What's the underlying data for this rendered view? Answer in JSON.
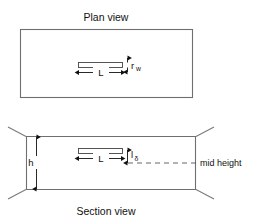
{
  "figure": {
    "background_color": "#ffffff",
    "outline_color": "#6f6f6f",
    "annotation_color": "#111111",
    "width": 262,
    "height": 224
  },
  "plan_view": {
    "title": "Plan view",
    "crack_length_label": "L",
    "crack_width_label": "r",
    "crack_width_subscript": "w"
  },
  "section_view": {
    "title": "Section view",
    "height_label": "h",
    "crack_length_label": "L",
    "crack_offset_label": "l",
    "crack_offset_subscript": "δ",
    "mid_height_label": "mid height"
  }
}
